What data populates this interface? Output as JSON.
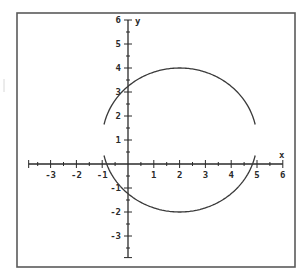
{
  "chart_data": {
    "type": "line",
    "title": "",
    "xlabel": "x",
    "ylabel": "y",
    "xlim": [
      -4,
      6
    ],
    "ylim": [
      -4,
      6
    ],
    "x_tick_labels": [
      "-3",
      "-2",
      "-1",
      "1",
      "2",
      "3",
      "4",
      "5",
      "6"
    ],
    "y_tick_labels": [
      "6",
      "5",
      "4",
      "3",
      "2",
      "1",
      "-1",
      "-2",
      "-3"
    ],
    "minor_ticks_per_unit": 2,
    "grid": false,
    "legend": null,
    "series": [
      {
        "name": "circle",
        "shape": "circle",
        "center": [
          2,
          1
        ],
        "radius": 3,
        "intercepts": {
          "y": [
            3.24,
            -1.24
          ],
          "x": [
            -0.83,
            4.83
          ]
        },
        "note": "plotted as upper and lower semicircle arcs with small gaps near x=-1 and x=5"
      }
    ],
    "colors": {
      "curve": "#3a3a3a",
      "axes": "#2a2a2a",
      "frame": "#555555"
    }
  }
}
